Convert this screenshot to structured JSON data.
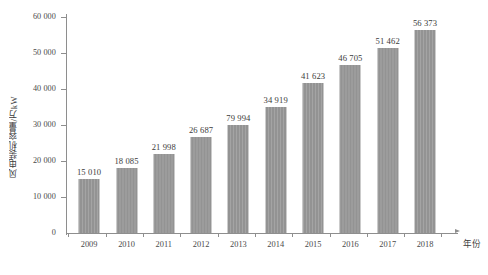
{
  "chart_data": {
    "type": "bar",
    "title": "",
    "xlabel": "年份",
    "ylabel": "风电装机容量/万kW",
    "categories": [
      "2009",
      "2010",
      "2011",
      "2012",
      "2013",
      "2014",
      "2015",
      "2016",
      "2017",
      "2018"
    ],
    "values": [
      15010,
      18085,
      21998,
      26687,
      29994,
      34919,
      41623,
      46705,
      51462,
      56373
    ],
    "value_labels": [
      "15 010",
      "18 085",
      "21 998",
      "26 687",
      "79 994",
      "34 919",
      "41 623",
      "46 705",
      "51 462",
      "56 373"
    ],
    "ylim": [
      0,
      60000
    ],
    "y_ticks": [
      0,
      10000,
      20000,
      30000,
      40000,
      50000,
      60000
    ],
    "y_tick_labels": [
      "0",
      "10 000",
      "20 000",
      "30 000",
      "40 000",
      "50 000",
      "60 000"
    ],
    "grid": false,
    "legend": null,
    "series": [
      {
        "name": "风电装机容量",
        "values": [
          15010,
          18085,
          21998,
          26687,
          29994,
          34919,
          41623,
          46705,
          51462,
          56373
        ]
      }
    ],
    "bar_color": "#939393",
    "axis_color": "#8e8e8e",
    "text_color": "#3b3b3b",
    "background_color": "#ffffff"
  }
}
